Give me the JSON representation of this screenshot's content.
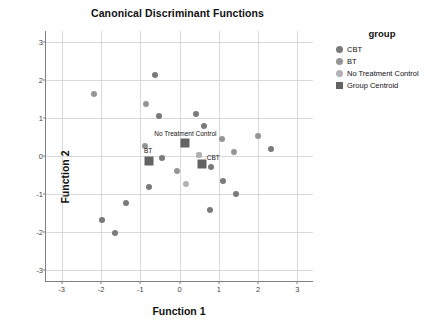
{
  "chart_data": {
    "type": "scatter",
    "title": "Canonical Discriminant Functions",
    "xlabel": "Function 1",
    "ylabel": "Function 2",
    "xlim": [
      -3.4,
      3.4
    ],
    "ylim": [
      -3.3,
      3.3
    ],
    "xticks": [
      "-3",
      "-2",
      "-1",
      "0",
      "1",
      "2",
      "3"
    ],
    "xtick_values": [
      -3,
      -2,
      -1,
      0,
      1,
      2,
      3
    ],
    "yticks": [
      "3",
      "2",
      "1",
      "0",
      "-1",
      "-2",
      "-3"
    ],
    "ytick_values": [
      3,
      2,
      1,
      0,
      -1,
      -2,
      -3
    ],
    "grid": true,
    "legend_position": "right",
    "legend_title": "group",
    "series": [
      {
        "name": "CBT",
        "marker": "circle",
        "color": "#7a7a7a",
        "points": [
          {
            "x": -0.62,
            "y": 2.14
          },
          {
            "x": -0.52,
            "y": 1.05
          },
          {
            "x": 0.43,
            "y": 1.12
          },
          {
            "x": 0.63,
            "y": 0.79
          },
          {
            "x": -0.45,
            "y": -0.05
          },
          {
            "x": -0.77,
            "y": -0.83
          },
          {
            "x": -1.35,
            "y": -1.24
          },
          {
            "x": -1.97,
            "y": -1.68
          },
          {
            "x": -1.63,
            "y": -2.02
          },
          {
            "x": 0.78,
            "y": -1.42
          },
          {
            "x": 1.11,
            "y": -0.65
          },
          {
            "x": 1.45,
            "y": -1.0
          },
          {
            "x": 2.33,
            "y": 0.18
          },
          {
            "x": 0.8,
            "y": -0.3
          }
        ]
      },
      {
        "name": "BT",
        "marker": "circle",
        "color": "#959595",
        "points": [
          {
            "x": -2.17,
            "y": 1.64
          },
          {
            "x": -0.86,
            "y": 1.38
          },
          {
            "x": -0.88,
            "y": 0.27
          },
          {
            "x": -0.07,
            "y": -0.39
          },
          {
            "x": 0.49,
            "y": 0.02
          },
          {
            "x": 1.09,
            "y": 0.44
          },
          {
            "x": 1.4,
            "y": 0.1
          },
          {
            "x": 1.99,
            "y": 0.53
          }
        ]
      },
      {
        "name": "No Treatment Control",
        "marker": "circle",
        "color": "#b3b3b3",
        "points": [
          {
            "x": 0.17,
            "y": -0.73
          },
          {
            "x": 0.49,
            "y": 0.02
          }
        ]
      },
      {
        "name": "Group Centroid",
        "marker": "square",
        "color": "#636363",
        "points": [
          {
            "x": 0.15,
            "y": 0.35,
            "label": "No Treatment Control"
          },
          {
            "x": -0.78,
            "y": -0.12,
            "label": "BT"
          },
          {
            "x": 0.58,
            "y": -0.22,
            "label": "CBT"
          }
        ]
      }
    ]
  },
  "legend": {
    "title": "group",
    "items": [
      {
        "label": "CBT",
        "color": "#7a7a7a",
        "shape": "circle"
      },
      {
        "label": "BT",
        "color": "#959595",
        "shape": "circle"
      },
      {
        "label": "No Treatment Control",
        "color": "#b3b3b3",
        "shape": "circle"
      },
      {
        "label": "Group Centroid",
        "color": "#636363",
        "shape": "square"
      }
    ]
  },
  "centroid_labels": [
    {
      "text": "No Treatment Control",
      "x": 0.15,
      "y": 0.6
    },
    {
      "text": "BT",
      "x": -0.8,
      "y": 0.16
    },
    {
      "text": "CBT",
      "x": 0.86,
      "y": -0.02
    }
  ],
  "colors": {
    "grid": "#d9d9d9",
    "axis": "#808080",
    "text": "#111111"
  }
}
